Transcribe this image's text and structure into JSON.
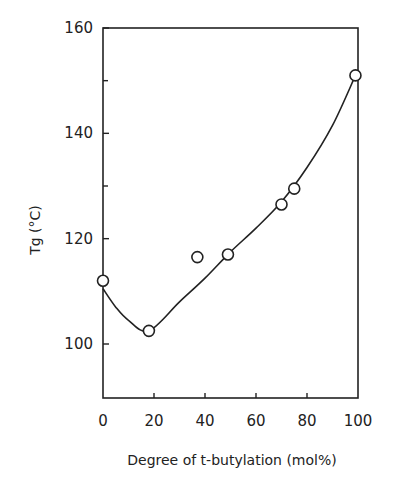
{
  "chart_data": {
    "type": "scatter",
    "title": "",
    "xlabel": "Degree of t-butylation (mol%)",
    "ylabel": "Tg (°C)",
    "xlim": [
      0,
      100
    ],
    "ylim": [
      90,
      160
    ],
    "x_ticks": [
      0,
      20,
      40,
      60,
      80,
      100
    ],
    "y_ticks": [
      100,
      120,
      140,
      160
    ],
    "y_minor_ticks": [
      130,
      150
    ],
    "grid": false,
    "legend": null,
    "series": [
      {
        "name": "Measured Tg",
        "marker": "open-circle",
        "x": [
          0,
          18,
          37,
          49,
          70,
          75,
          99
        ],
        "y": [
          112,
          102.5,
          116.5,
          117,
          126.5,
          129.5,
          151
        ]
      },
      {
        "name": "Fitted curve",
        "style": "line",
        "x": [
          0,
          5,
          10,
          18,
          30,
          40,
          50,
          60,
          70,
          80,
          90,
          99
        ],
        "y": [
          110.5,
          107,
          104.5,
          102.5,
          108,
          112.5,
          117.5,
          122,
          127,
          133.5,
          141.5,
          151
        ]
      }
    ]
  },
  "labels": {
    "x_ticks": [
      "0",
      "20",
      "40",
      "60",
      "80",
      "100"
    ],
    "y_ticks": [
      "100",
      "120",
      "140",
      "160"
    ],
    "xlabel": "Degree of t-butylation (mol%)",
    "ylabel": "Tg (°C)"
  }
}
